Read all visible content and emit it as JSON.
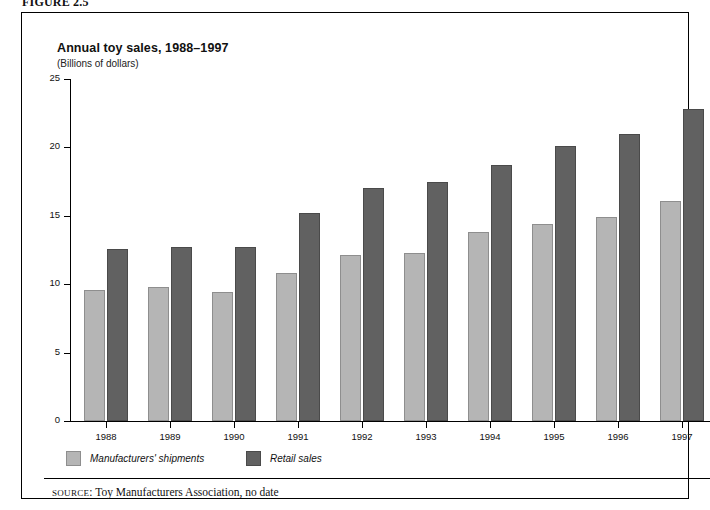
{
  "figure": {
    "label": "FIGURE 2.5"
  },
  "chart_data": {
    "type": "bar",
    "title": "Annual toy sales, 1988–1997",
    "subtitle": "(Billions of dollars)",
    "xlabel": "",
    "ylabel": "",
    "unit_note": "(Billions of dollars)",
    "categories": [
      "1988",
      "1989",
      "1990",
      "1991",
      "1992",
      "1993",
      "1994",
      "1995",
      "1996",
      "1997"
    ],
    "series": [
      {
        "name": "Manufacturers' shipments",
        "color": "#b5b5b5",
        "values": [
          9.6,
          9.8,
          9.4,
          10.8,
          12.1,
          12.3,
          13.8,
          14.4,
          14.9,
          16.1
        ]
      },
      {
        "name": "Retail sales",
        "color": "#616161",
        "values": [
          12.6,
          12.7,
          12.7,
          15.2,
          17.0,
          17.5,
          18.7,
          20.1,
          21.0,
          22.8
        ]
      }
    ],
    "ylim": [
      0,
      25
    ],
    "yticks": [
      "0",
      "5",
      "10",
      "15",
      "20",
      "25"
    ],
    "ytick_values": [
      0,
      5,
      10,
      15,
      20,
      25
    ],
    "grid": false,
    "legend_position": "bottom-left"
  },
  "legend": {
    "items": [
      {
        "label": "Manufacturers' shipments",
        "swatch": "light"
      },
      {
        "label": "Retail sales",
        "swatch": "dark"
      }
    ]
  },
  "source": {
    "prefix": "SOURCE",
    "separator": ": ",
    "text": "Toy Manufacturers Association, no date"
  }
}
